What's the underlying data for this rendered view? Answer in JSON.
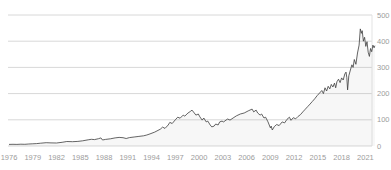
{
  "chart_data": {
    "type": "area",
    "title": "",
    "xlabel": "",
    "ylabel": "",
    "legend": "none",
    "grid": "horizontal",
    "x_axis": {
      "min": 1975.9,
      "max": 2022.6,
      "tick_labels": [
        "1976",
        "1979",
        "1982",
        "1985",
        "1988",
        "1991",
        "1994",
        "1997",
        "2000",
        "2003",
        "2006",
        "2009",
        "2012",
        "2015",
        "2018",
        "2021"
      ],
      "tick_values": [
        1976,
        1979,
        1982,
        1985,
        1988,
        1991,
        1994,
        1997,
        2000,
        2003,
        2006,
        2009,
        2012,
        2015,
        2018,
        2021
      ],
      "position": "bottom"
    },
    "y_axis": {
      "min": 0,
      "max": 557,
      "tick_labels": [
        "0",
        "100",
        "200",
        "300",
        "400",
        "500"
      ],
      "tick_values": [
        0,
        100,
        200,
        300,
        400,
        500
      ],
      "position": "right"
    },
    "colors": {
      "line": "#3d3d3d",
      "fill": "#888888",
      "fill_opacity": "0.07",
      "grid": "#d8d8d8",
      "right_border": "#e3e3e3",
      "tick_label": "#9c9c9c",
      "background": "#ffffff"
    },
    "series": [
      {
        "name": "index-price",
        "points": [
          [
            1976,
            6
          ],
          [
            1976.5,
            6.5
          ],
          [
            1977,
            6.2
          ],
          [
            1977.5,
            6.8
          ],
          [
            1978,
            6.5
          ],
          [
            1978.5,
            7.5
          ],
          [
            1979,
            8.5
          ],
          [
            1979.5,
            9
          ],
          [
            1980,
            10.5
          ],
          [
            1980.7,
            12.5
          ],
          [
            1981.3,
            12
          ],
          [
            1982,
            11.5
          ],
          [
            1982.7,
            14
          ],
          [
            1983.3,
            17
          ],
          [
            1984,
            16.5
          ],
          [
            1984.7,
            17.5
          ],
          [
            1985.3,
            20
          ],
          [
            1986,
            23.5
          ],
          [
            1986.4,
            25.5
          ],
          [
            1986.8,
            24.5
          ],
          [
            1987.3,
            28
          ],
          [
            1987.6,
            31
          ],
          [
            1987.8,
            23
          ],
          [
            1988.2,
            25
          ],
          [
            1988.8,
            27.5
          ],
          [
            1989.4,
            31
          ],
          [
            1989.9,
            33
          ],
          [
            1990.4,
            31.5
          ],
          [
            1990.8,
            28.5
          ],
          [
            1991.2,
            32
          ],
          [
            1991.8,
            34.5
          ],
          [
            1992.4,
            36.5
          ],
          [
            1993,
            39
          ],
          [
            1993.4,
            42
          ],
          [
            1993.8,
            46
          ],
          [
            1994.4,
            53
          ],
          [
            1995.1,
            64
          ],
          [
            1995.4,
            72
          ],
          [
            1995.7,
            67
          ],
          [
            1996.1,
            80
          ],
          [
            1996.3,
            90
          ],
          [
            1996.6,
            86
          ],
          [
            1997,
            100
          ],
          [
            1997.3,
            110
          ],
          [
            1997.6,
            106
          ],
          [
            1998,
            118
          ],
          [
            1998.2,
            114
          ],
          [
            1998.6,
            126
          ],
          [
            1998.9,
            132
          ],
          [
            1999.1,
            137
          ],
          [
            1999.4,
            126
          ],
          [
            1999.6,
            118
          ],
          [
            1999.9,
            122
          ],
          [
            2000.1,
            111
          ],
          [
            2000.4,
            99
          ],
          [
            2000.6,
            107
          ],
          [
            2000.9,
            92
          ],
          [
            2001.1,
            95
          ],
          [
            2001.4,
            80
          ],
          [
            2001.6,
            73
          ],
          [
            2001.9,
            76
          ],
          [
            2002.1,
            84
          ],
          [
            2002.4,
            80
          ],
          [
            2002.6,
            92
          ],
          [
            2002.9,
            95
          ],
          [
            2003.1,
            92
          ],
          [
            2003.4,
            99
          ],
          [
            2003.6,
            103
          ],
          [
            2003.9,
            99
          ],
          [
            2004.3,
            107
          ],
          [
            2004.7,
            115
          ],
          [
            2005.2,
            122
          ],
          [
            2005.7,
            126
          ],
          [
            2006.2,
            134
          ],
          [
            2006.7,
            141
          ],
          [
            2006.9,
            130
          ],
          [
            2007.2,
            137
          ],
          [
            2007.4,
            126
          ],
          [
            2007.7,
            118
          ],
          [
            2007.9,
            122
          ],
          [
            2008.2,
            107
          ],
          [
            2008.4,
            110
          ],
          [
            2008.7,
            92
          ],
          [
            2009,
            69
          ],
          [
            2009.1,
            76
          ],
          [
            2009.25,
            61
          ],
          [
            2009.5,
            74
          ],
          [
            2009.8,
            82
          ],
          [
            2010.1,
            78
          ],
          [
            2010.5,
            92
          ],
          [
            2010.8,
            88
          ],
          [
            2011.1,
            102
          ],
          [
            2011.4,
            110
          ],
          [
            2011.6,
            98
          ],
          [
            2011.9,
            108
          ],
          [
            2012.2,
            104
          ],
          [
            2012.5,
            113
          ],
          [
            2012.8,
            120
          ],
          [
            2013.1,
            130
          ],
          [
            2013.4,
            140
          ],
          [
            2013.7,
            150
          ],
          [
            2014,
            160
          ],
          [
            2014.3,
            170
          ],
          [
            2014.6,
            180
          ],
          [
            2014.9,
            192
          ],
          [
            2015.2,
            202
          ],
          [
            2015.5,
            212
          ],
          [
            2015.7,
            200
          ],
          [
            2015.9,
            222
          ],
          [
            2016.1,
            210
          ],
          [
            2016.3,
            228
          ],
          [
            2016.5,
            218
          ],
          [
            2016.7,
            235
          ],
          [
            2016.9,
            225
          ],
          [
            2017.1,
            240
          ],
          [
            2017.25,
            222
          ],
          [
            2017.4,
            245
          ],
          [
            2017.6,
            255
          ],
          [
            2017.8,
            242
          ],
          [
            2018,
            260
          ],
          [
            2018.2,
            252
          ],
          [
            2018.4,
            275
          ],
          [
            2018.55,
            282
          ],
          [
            2018.65,
            262
          ],
          [
            2018.75,
            214
          ],
          [
            2018.9,
            268
          ],
          [
            2019.1,
            290
          ],
          [
            2019.3,
            310
          ],
          [
            2019.45,
            300
          ],
          [
            2019.6,
            330
          ],
          [
            2019.8,
            312
          ],
          [
            2020,
            355
          ],
          [
            2020.2,
            385
          ],
          [
            2020.35,
            447
          ],
          [
            2020.5,
            430
          ],
          [
            2020.6,
            440
          ],
          [
            2020.75,
            400
          ],
          [
            2020.9,
            415
          ],
          [
            2021.05,
            380
          ],
          [
            2021.2,
            398
          ],
          [
            2021.35,
            358
          ],
          [
            2021.5,
            342
          ],
          [
            2021.65,
            372
          ],
          [
            2021.8,
            360
          ],
          [
            2021.95,
            385
          ],
          [
            2022.1,
            375
          ],
          [
            2022.2,
            383
          ]
        ]
      }
    ]
  }
}
